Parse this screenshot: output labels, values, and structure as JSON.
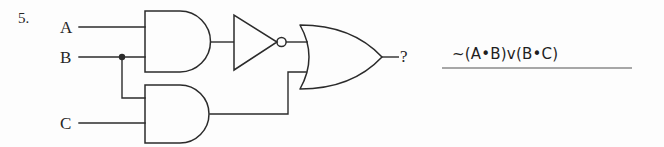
{
  "problem": {
    "number": "5.",
    "answer_expression": "~(A•B)v(B•C)"
  },
  "circuit": {
    "inputs": [
      {
        "label": "A",
        "name": "input-a"
      },
      {
        "label": "B",
        "name": "input-b"
      },
      {
        "label": "C",
        "name": "input-c"
      }
    ],
    "output": {
      "label": "?",
      "name": "output-terminal"
    },
    "gates": [
      {
        "name": "and-gate-top",
        "type": "AND",
        "inputs": [
          "A",
          "B"
        ]
      },
      {
        "name": "not-gate",
        "type": "NOT",
        "inputs": [
          "AND-top"
        ]
      },
      {
        "name": "and-gate-bottom",
        "type": "AND",
        "inputs": [
          "B",
          "C"
        ]
      },
      {
        "name": "or-gate",
        "type": "OR",
        "inputs": [
          "NOT",
          "AND-bottom"
        ]
      }
    ],
    "junctions": [
      {
        "name": "junction-b",
        "on": "B"
      }
    ]
  },
  "colors": {
    "ink": "#262626",
    "wire": "#2b2b2b",
    "paper": "#fdfdfd",
    "rule": "#8a8a8a"
  }
}
